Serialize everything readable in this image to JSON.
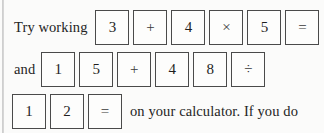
{
  "page": {
    "background_color": "#fbfbfa",
    "text_color": "#242424",
    "key_border_color": "#4a4a4a",
    "gutter_color": "#c9c9c9"
  },
  "lines": [
    {
      "id": "line-1",
      "lead_text": "Try working",
      "trail_text": "",
      "keys": [
        {
          "label": "3",
          "kind": "digit",
          "name": "calculator-key-3"
        },
        {
          "label": "+",
          "kind": "operator",
          "name": "calculator-key-plus"
        },
        {
          "label": "4",
          "kind": "digit",
          "name": "calculator-key-4"
        },
        {
          "label": "×",
          "kind": "operator",
          "name": "calculator-key-multiply"
        },
        {
          "label": "5",
          "kind": "digit",
          "name": "calculator-key-5"
        },
        {
          "label": "=",
          "kind": "operator",
          "name": "calculator-key-equals"
        }
      ]
    },
    {
      "id": "line-2",
      "lead_text": "and",
      "trail_text": "",
      "keys": [
        {
          "label": "1",
          "kind": "digit",
          "name": "calculator-key-1"
        },
        {
          "label": "5",
          "kind": "digit",
          "name": "calculator-key-5"
        },
        {
          "label": "+",
          "kind": "operator",
          "name": "calculator-key-plus"
        },
        {
          "label": "4",
          "kind": "digit",
          "name": "calculator-key-4"
        },
        {
          "label": "8",
          "kind": "digit",
          "name": "calculator-key-8"
        },
        {
          "label": "÷",
          "kind": "operator",
          "name": "calculator-key-divide"
        }
      ]
    },
    {
      "id": "line-3",
      "lead_text": "",
      "trail_text": "on your calculator. If you do",
      "keys": [
        {
          "label": "1",
          "kind": "digit",
          "name": "calculator-key-1"
        },
        {
          "label": "2",
          "kind": "digit",
          "name": "calculator-key-2"
        },
        {
          "label": "=",
          "kind": "operator",
          "name": "calculator-key-equals"
        }
      ]
    }
  ],
  "full_text": "Try working 3 + 4 × 5 = and 1 5 + 4 8 ÷ 1 2 = on your calculator. If you do"
}
